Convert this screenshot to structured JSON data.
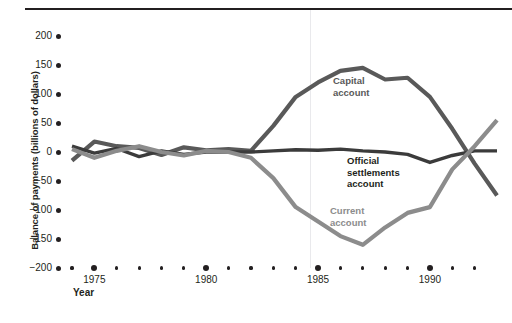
{
  "figure": {
    "background": "#ffffff",
    "ink": "#231f20"
  },
  "axes": {
    "y_title": "Balance of payments (billions of dollars)",
    "x_title": "Year",
    "y_ticks": [
      "200",
      "150",
      "100",
      "50",
      "0",
      "−50",
      "−100",
      "−150",
      "−200"
    ],
    "y_values": [
      200,
      150,
      100,
      50,
      0,
      -50,
      -100,
      -150,
      -200
    ],
    "y_min": -200,
    "y_max": 200,
    "x_min": 1974,
    "x_max": 1993,
    "x_major_labels": [
      "1975",
      "1980",
      "1985",
      "1990"
    ],
    "x_major_values": [
      1975,
      1980,
      1985,
      1990
    ],
    "x_all_ticks": [
      1974,
      1975,
      1976,
      1977,
      1978,
      1979,
      1980,
      1981,
      1982,
      1983,
      1984,
      1985,
      1986,
      1987,
      1988,
      1989,
      1990,
      1991,
      1992
    ]
  },
  "legend": {
    "capital": "Capital\naccount",
    "official": "Official\nsettlements\naccount",
    "current": "Current\naccount"
  },
  "chart_data": {
    "type": "line",
    "title": "",
    "xlabel": "Year",
    "ylabel": "Balance of payments (billions of dollars)",
    "xlim": [
      1974,
      1993
    ],
    "ylim": [
      -200,
      200
    ],
    "grid": false,
    "legend_position": "inline-annotations",
    "x": [
      1974,
      1975,
      1976,
      1977,
      1978,
      1979,
      1980,
      1981,
      1982,
      1983,
      1984,
      1985,
      1986,
      1987,
      1988,
      1989,
      1990,
      1991,
      1992,
      1993
    ],
    "series": [
      {
        "name": "Capital account",
        "color": "#595959",
        "values": [
          -15,
          18,
          10,
          7,
          -5,
          8,
          3,
          5,
          2,
          45,
          95,
          120,
          140,
          145,
          125,
          128,
          95,
          40,
          -20,
          -75
        ]
      },
      {
        "name": "Official settlements account",
        "color": "#3b3b3b",
        "values": [
          10,
          -2,
          6,
          -8,
          2,
          -4,
          0,
          0,
          0,
          2,
          4,
          3,
          5,
          2,
          0,
          -4,
          -18,
          -6,
          2,
          2
        ]
      },
      {
        "name": "Current account",
        "color": "#8c8c8c",
        "values": [
          5,
          -10,
          2,
          10,
          0,
          -6,
          2,
          0,
          -10,
          -45,
          -95,
          -120,
          -145,
          -160,
          -130,
          -105,
          -95,
          -30,
          10,
          55
        ]
      }
    ]
  }
}
